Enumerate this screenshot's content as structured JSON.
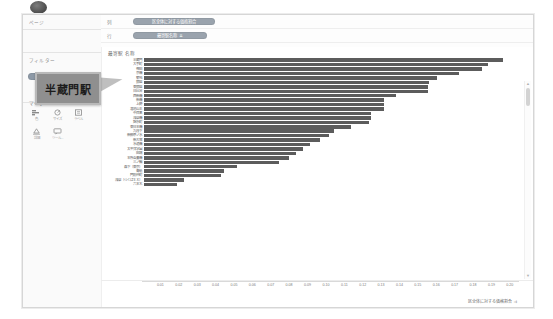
{
  "window": {
    "badge_icon": "dark-circle-badge"
  },
  "left_panel": {
    "pages_label": "ページ",
    "filters_label": "フィルター",
    "filter_pill": "用途地域名称",
    "marks_label": "マーク",
    "marks_buttons": [
      {
        "icon": "bar-mark-icon",
        "caption": "色"
      },
      {
        "icon": "size-mark-icon",
        "caption": "サイズ"
      },
      {
        "icon": "label-mark-icon",
        "caption": "ラベル"
      },
      {
        "icon": "detail-mark-icon",
        "caption": "詳細"
      },
      {
        "icon": "tooltip-mark-icon",
        "caption": "ツール..."
      }
    ]
  },
  "tooltip": {
    "text": "半蔵門駅",
    "pointer_icon": "callout-arrow-icon"
  },
  "shelves": [
    {
      "label": "列",
      "pill": "区全体に対する価格割合",
      "type": "measure"
    },
    {
      "label": "行",
      "pill": "最寄駅名称",
      "sort_icon": "sort-desc-icon",
      "type": "dimension"
    }
  ],
  "chart_data": {
    "type": "bar",
    "orientation": "horizontal",
    "title": "最寄駅 名称",
    "xlabel": "区全体に対する価格割合",
    "ylabel": "",
    "xlim": [
      0,
      0.205
    ],
    "grid": false,
    "legend": false,
    "bar_color": "#5c5c5c",
    "xticks": [
      "0.01",
      "0.02",
      "0.03",
      "0.04",
      "0.05",
      "0.06",
      "0.07",
      "0.08",
      "0.09",
      "0.10",
      "0.11",
      "0.12",
      "0.13",
      "0.14",
      "0.15",
      "0.16",
      "0.17",
      "0.18",
      "0.19",
      "0.20"
    ],
    "xtick_values": [
      0.01,
      0.02,
      0.03,
      0.04,
      0.05,
      0.06,
      0.07,
      0.08,
      0.09,
      0.1,
      0.11,
      0.12,
      0.13,
      0.14,
      0.15,
      0.16,
      0.17,
      0.18,
      0.19,
      0.2
    ],
    "categories": [
      "半蔵門",
      "大手町",
      "神田",
      "京橋",
      "築地",
      "銀座",
      "東銀座",
      "日比谷",
      "西新橋",
      "新橋",
      "上野",
      "溜池山王",
      "中目黒",
      "浅草橋",
      "錦糸町",
      "東日本橋",
      "九段下",
      "新御茶ノ水",
      "新大塚",
      "水道橋",
      "太平洋学園",
      "田端",
      "本所吾妻橋",
      "三ノ輪",
      "森下（東京）",
      "青砥",
      "門前仲町",
      "浅草（つくばＥＸ）",
      "六本木"
    ],
    "values": [
      0.196,
      0.188,
      0.185,
      0.172,
      0.16,
      0.156,
      0.155,
      0.155,
      0.138,
      0.131,
      0.131,
      0.131,
      0.124,
      0.124,
      0.123,
      0.113,
      0.104,
      0.101,
      0.096,
      0.091,
      0.087,
      0.083,
      0.079,
      0.074,
      0.051,
      0.044,
      0.042,
      0.022,
      0.018
    ]
  },
  "scrollbar": {
    "up_icon": "scroll-up-arrow-icon",
    "down_icon": "scroll-down-arrow-icon"
  }
}
